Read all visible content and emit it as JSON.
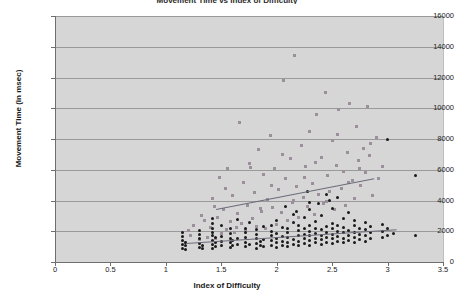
{
  "chart_data": {
    "type": "scatter",
    "title": "Movement Time vs Index of Difficulty",
    "xlabel": "Index of Difficulty",
    "ylabel": "Movement Time (in msec)",
    "xlim": [
      0,
      3.5
    ],
    "ylim": [
      0,
      16000
    ],
    "xticks": [
      "0",
      "0.5",
      "1",
      "1.5",
      "2",
      "2.5",
      "3",
      "3.5"
    ],
    "xtick_values": [
      0,
      0.5,
      1,
      1.5,
      2,
      2.5,
      3,
      3.5
    ],
    "yticks": [
      "0",
      "2000",
      "4000",
      "6000",
      "8000",
      "10000",
      "12000",
      "14000",
      "16000"
    ],
    "ytick_values": [
      0,
      2000,
      4000,
      6000,
      8000,
      10000,
      12000,
      14000,
      16000
    ],
    "grid": "horizontal",
    "legend": "none",
    "plot_background": "#d6d6d6",
    "series": [
      {
        "name": "Series A",
        "marker": "square",
        "color": "#9b8f9b",
        "points": [
          [
            1.22,
            1750
          ],
          [
            1.25,
            2400
          ],
          [
            1.3,
            1450
          ],
          [
            1.32,
            3050
          ],
          [
            1.38,
            1600
          ],
          [
            1.4,
            2250
          ],
          [
            1.42,
            4100
          ],
          [
            1.45,
            1500
          ],
          [
            1.47,
            2900
          ],
          [
            1.48,
            5500
          ],
          [
            1.5,
            1850
          ],
          [
            1.52,
            3400
          ],
          [
            1.55,
            2100
          ],
          [
            1.56,
            6050
          ],
          [
            1.58,
            2650
          ],
          [
            1.6,
            4300
          ],
          [
            1.62,
            1950
          ],
          [
            1.65,
            3150
          ],
          [
            1.66,
            9100
          ],
          [
            1.68,
            2500
          ],
          [
            1.7,
            5200
          ],
          [
            1.72,
            2050
          ],
          [
            1.74,
            3700
          ],
          [
            1.75,
            6400
          ],
          [
            1.78,
            2800
          ],
          [
            1.8,
            4500
          ],
          [
            1.82,
            2300
          ],
          [
            1.84,
            7300
          ],
          [
            1.86,
            3300
          ],
          [
            1.88,
            5700
          ],
          [
            1.9,
            2150
          ],
          [
            1.92,
            4050
          ],
          [
            1.94,
            8200
          ],
          [
            1.96,
            3550
          ],
          [
            1.98,
            6100
          ],
          [
            2.0,
            2450
          ],
          [
            2.02,
            4700
          ],
          [
            2.04,
            3200
          ],
          [
            2.06,
            11800
          ],
          [
            2.08,
            5400
          ],
          [
            2.1,
            2700
          ],
          [
            2.12,
            6700
          ],
          [
            2.14,
            3900
          ],
          [
            2.16,
            13400
          ],
          [
            2.18,
            4900
          ],
          [
            2.2,
            2900
          ],
          [
            2.22,
            7600
          ],
          [
            2.24,
            4200
          ],
          [
            2.26,
            6200
          ],
          [
            2.28,
            3600
          ],
          [
            2.3,
            8500
          ],
          [
            2.32,
            5100
          ],
          [
            2.34,
            3100
          ],
          [
            2.36,
            9600
          ],
          [
            2.38,
            4400
          ],
          [
            2.4,
            6800
          ],
          [
            2.42,
            3800
          ],
          [
            2.44,
            11000
          ],
          [
            2.46,
            5600
          ],
          [
            2.48,
            4600
          ],
          [
            2.5,
            7900
          ],
          [
            2.52,
            3400
          ],
          [
            2.54,
            6300
          ],
          [
            2.56,
            9900
          ],
          [
            2.58,
            4800
          ],
          [
            2.6,
            5900
          ],
          [
            2.62,
            3700
          ],
          [
            2.64,
            7100
          ],
          [
            2.66,
            10300
          ],
          [
            2.68,
            5300
          ],
          [
            2.7,
            4100
          ],
          [
            2.72,
            8800
          ],
          [
            2.74,
            6600
          ],
          [
            2.76,
            4950
          ],
          [
            2.78,
            7400
          ],
          [
            2.8,
            5800
          ],
          [
            2.82,
            10100
          ],
          [
            2.84,
            6900
          ],
          [
            2.86,
            4350
          ],
          [
            2.9,
            8100
          ],
          [
            1.18,
            1300
          ],
          [
            1.2,
            2050
          ],
          [
            1.35,
            2700
          ],
          [
            1.44,
            3600
          ],
          [
            1.54,
            4800
          ],
          [
            1.64,
            2250
          ],
          [
            1.76,
            6150
          ],
          [
            1.85,
            3450
          ],
          [
            1.95,
            5000
          ],
          [
            2.05,
            7000
          ],
          [
            2.15,
            4000
          ],
          [
            2.25,
            5500
          ],
          [
            2.35,
            6450
          ],
          [
            2.45,
            3950
          ],
          [
            2.55,
            8300
          ],
          [
            2.65,
            5150
          ],
          [
            2.75,
            6050
          ],
          [
            2.85,
            7700
          ],
          [
            2.92,
            5400
          ],
          [
            2.95,
            6200
          ]
        ]
      },
      {
        "name": "Series B",
        "marker": "circle",
        "color": "#1a1a1a",
        "points": [
          [
            1.15,
            900
          ],
          [
            1.15,
            1150
          ],
          [
            1.15,
            1400
          ],
          [
            1.15,
            1650
          ],
          [
            1.15,
            1900
          ],
          [
            1.18,
            800
          ],
          [
            1.18,
            1050
          ],
          [
            1.18,
            1300
          ],
          [
            1.3,
            950
          ],
          [
            1.3,
            1200
          ],
          [
            1.3,
            1500
          ],
          [
            1.3,
            1800
          ],
          [
            1.3,
            2050
          ],
          [
            1.33,
            850
          ],
          [
            1.33,
            1100
          ],
          [
            1.42,
            900
          ],
          [
            1.42,
            1150
          ],
          [
            1.42,
            1400
          ],
          [
            1.42,
            1700
          ],
          [
            1.42,
            1950
          ],
          [
            1.42,
            2200
          ],
          [
            1.42,
            2500
          ],
          [
            1.42,
            2800
          ],
          [
            1.45,
            1000
          ],
          [
            1.45,
            1300
          ],
          [
            1.45,
            1600
          ],
          [
            1.58,
            950
          ],
          [
            1.58,
            1250
          ],
          [
            1.58,
            1550
          ],
          [
            1.58,
            1850
          ],
          [
            1.58,
            2150
          ],
          [
            1.6,
            1100
          ],
          [
            1.6,
            1400
          ],
          [
            1.72,
            1000
          ],
          [
            1.72,
            1300
          ],
          [
            1.72,
            1600
          ],
          [
            1.72,
            1900
          ],
          [
            1.72,
            2200
          ],
          [
            1.75,
            1150
          ],
          [
            1.75,
            2600
          ],
          [
            1.82,
            900
          ],
          [
            1.82,
            1200
          ],
          [
            1.82,
            1500
          ],
          [
            1.82,
            1800
          ],
          [
            1.82,
            2100
          ],
          [
            1.85,
            1050
          ],
          [
            1.85,
            1350
          ],
          [
            1.88,
            1000
          ],
          [
            1.88,
            1450
          ],
          [
            1.88,
            2300
          ],
          [
            1.95,
            1100
          ],
          [
            1.95,
            1400
          ],
          [
            1.95,
            1700
          ],
          [
            1.95,
            2000
          ],
          [
            1.95,
            2400
          ],
          [
            2.0,
            950
          ],
          [
            2.0,
            1250
          ],
          [
            2.0,
            1550
          ],
          [
            2.0,
            1850
          ],
          [
            2.0,
            2700
          ],
          [
            2.05,
            1050
          ],
          [
            2.05,
            1350
          ],
          [
            2.05,
            1650
          ],
          [
            2.05,
            2250
          ],
          [
            2.1,
            1000
          ],
          [
            2.1,
            1300
          ],
          [
            2.1,
            1600
          ],
          [
            2.1,
            1900
          ],
          [
            2.1,
            2200
          ],
          [
            2.15,
            1150
          ],
          [
            2.15,
            1450
          ],
          [
            2.15,
            2550
          ],
          [
            2.15,
            3100
          ],
          [
            2.2,
            1050
          ],
          [
            2.2,
            1350
          ],
          [
            2.2,
            1750
          ],
          [
            2.2,
            2050
          ],
          [
            2.2,
            2400
          ],
          [
            2.25,
            1200
          ],
          [
            2.25,
            1500
          ],
          [
            2.25,
            1800
          ],
          [
            2.25,
            2150
          ],
          [
            2.25,
            2900
          ],
          [
            2.3,
            1100
          ],
          [
            2.3,
            1400
          ],
          [
            2.3,
            1700
          ],
          [
            2.3,
            2000
          ],
          [
            2.3,
            2350
          ],
          [
            2.3,
            3400
          ],
          [
            2.3,
            3900
          ],
          [
            2.35,
            1250
          ],
          [
            2.35,
            1550
          ],
          [
            2.35,
            1850
          ],
          [
            2.35,
            2200
          ],
          [
            2.35,
            2650
          ],
          [
            2.4,
            1150
          ],
          [
            2.4,
            1450
          ],
          [
            2.4,
            1750
          ],
          [
            2.4,
            2100
          ],
          [
            2.4,
            3000
          ],
          [
            2.45,
            1300
          ],
          [
            2.45,
            1600
          ],
          [
            2.45,
            1950
          ],
          [
            2.45,
            2300
          ],
          [
            2.45,
            4400
          ],
          [
            2.5,
            1200
          ],
          [
            2.5,
            1500
          ],
          [
            2.5,
            1800
          ],
          [
            2.5,
            2150
          ],
          [
            2.5,
            2500
          ],
          [
            2.5,
            3500
          ],
          [
            2.55,
            1350
          ],
          [
            2.55,
            1650
          ],
          [
            2.55,
            2000
          ],
          [
            2.55,
            2400
          ],
          [
            2.55,
            4200
          ],
          [
            2.6,
            1250
          ],
          [
            2.6,
            1550
          ],
          [
            2.6,
            1900
          ],
          [
            2.6,
            2250
          ],
          [
            2.6,
            2800
          ],
          [
            2.65,
            1400
          ],
          [
            2.65,
            1700
          ],
          [
            2.65,
            2050
          ],
          [
            2.65,
            3200
          ],
          [
            2.7,
            1300
          ],
          [
            2.7,
            1600
          ],
          [
            2.7,
            1950
          ],
          [
            2.7,
            2350
          ],
          [
            2.7,
            2700
          ],
          [
            2.75,
            1450
          ],
          [
            2.75,
            1800
          ],
          [
            2.75,
            2200
          ],
          [
            2.8,
            1350
          ],
          [
            2.8,
            1700
          ],
          [
            2.8,
            2100
          ],
          [
            2.8,
            2600
          ],
          [
            2.85,
            1500
          ],
          [
            2.85,
            1900
          ],
          [
            2.85,
            2300
          ],
          [
            2.95,
            1600
          ],
          [
            2.95,
            2000
          ],
          [
            2.95,
            2450
          ],
          [
            3.0,
            1700
          ],
          [
            3.0,
            2150
          ],
          [
            3.0,
            8000
          ],
          [
            3.05,
            1850
          ],
          [
            3.25,
            1750
          ],
          [
            3.25,
            5600
          ],
          [
            1.5,
            1050
          ],
          [
            1.5,
            1350
          ],
          [
            1.5,
            1650
          ],
          [
            1.5,
            2400
          ],
          [
            1.65,
            1150
          ],
          [
            1.65,
            1500
          ],
          [
            1.65,
            2750
          ],
          [
            2.08,
            3600
          ],
          [
            2.18,
            3300
          ],
          [
            2.28,
            4600
          ],
          [
            2.38,
            3800
          ],
          [
            2.48,
            4000
          ]
        ]
      }
    ],
    "trendlines": [
      {
        "name": "Series A trendline",
        "x0": 1.45,
        "y0": 3450,
        "x1": 2.88,
        "y1": 5450,
        "color": "#6b6b7a"
      },
      {
        "name": "Series B trendline",
        "x0": 1.18,
        "y0": 1250,
        "x1": 3.08,
        "y1": 2150,
        "color": "#6b6b7a"
      }
    ]
  }
}
